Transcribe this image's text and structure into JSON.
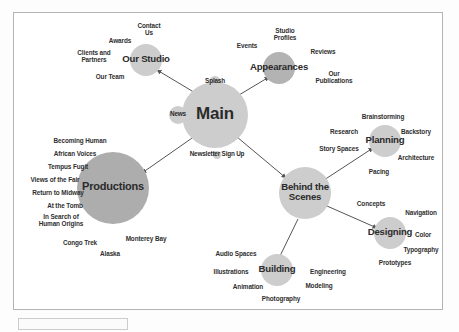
{
  "diagram": {
    "background": "#ffffff",
    "frame_border": "#b4b4b4",
    "node_color_light": "#cdcdcd",
    "node_color_mid": "#b3b3b3",
    "node_color_dark": "#adadad",
    "edge_color": "#555555",
    "text_color": "#2b2b2b"
  },
  "nodes": [
    {
      "id": "main",
      "label": "Main",
      "cx": 215,
      "cy": 115,
      "r": 33,
      "font": 17,
      "tone": "light"
    },
    {
      "id": "our_studio",
      "label": "Our Studio",
      "cx": 146,
      "cy": 60,
      "r": 16,
      "font": 9.6,
      "tone": "light"
    },
    {
      "id": "appearances",
      "label": "Appearances",
      "cx": 279,
      "cy": 68,
      "r": 16,
      "font": 9.6,
      "tone": "mid"
    },
    {
      "id": "productions",
      "label": "Productions",
      "cx": 113,
      "cy": 188,
      "r": 36,
      "font": 11,
      "tone": "dark"
    },
    {
      "id": "behind",
      "label": "Behind the\nScenes",
      "cx": 305,
      "cy": 193,
      "r": 26,
      "font": 9.6,
      "tone": "light"
    },
    {
      "id": "planning",
      "label": "Planning",
      "cx": 385,
      "cy": 141,
      "r": 16,
      "font": 9.6,
      "tone": "light"
    },
    {
      "id": "designing",
      "label": "Designing",
      "cx": 390,
      "cy": 233,
      "r": 16,
      "font": 9.6,
      "tone": "light"
    },
    {
      "id": "building",
      "label": "Building",
      "cx": 277,
      "cy": 270,
      "r": 16,
      "font": 9.6,
      "tone": "light"
    },
    {
      "id": "news",
      "label": "News",
      "cx": 178,
      "cy": 115,
      "r": 9,
      "font": 6.4,
      "tone": "light"
    },
    {
      "id": "splash",
      "label": "Splash",
      "cx": 215,
      "cy": 82,
      "r": 6,
      "font": 6.4,
      "tone": "light"
    },
    {
      "id": "newsletter",
      "label": "Newsletter Sign Up",
      "cx": 217,
      "cy": 155,
      "r": 4,
      "font": 6.4,
      "tone": "light"
    }
  ],
  "edges": [
    {
      "from": "main",
      "to": "our_studio",
      "x1": 197,
      "y1": 94,
      "x2": 157,
      "y2": 70,
      "arrow": true
    },
    {
      "from": "main",
      "to": "appearances",
      "x1": 234,
      "y1": 98,
      "x2": 269,
      "y2": 77,
      "arrow": true
    },
    {
      "from": "main",
      "to": "productions",
      "x1": 195,
      "y1": 136,
      "x2": 142,
      "y2": 173,
      "arrow": true
    },
    {
      "from": "main",
      "to": "behind",
      "x1": 237,
      "y1": 137,
      "x2": 286,
      "y2": 178,
      "arrow": true
    },
    {
      "from": "behind",
      "to": "planning",
      "x1": 324,
      "y1": 180,
      "x2": 373,
      "y2": 148,
      "arrow": true
    },
    {
      "from": "behind",
      "to": "designing",
      "x1": 327,
      "y1": 206,
      "x2": 377,
      "y2": 228,
      "arrow": true
    },
    {
      "from": "behind",
      "to": "building",
      "x1": 298,
      "y1": 219,
      "x2": 280,
      "y2": 256,
      "arrow": false
    }
  ],
  "labels": [
    {
      "text": "Contact\nUs",
      "x": 126,
      "y": 22,
      "w": 46
    },
    {
      "text": "Awards",
      "x": 97,
      "y": 37,
      "w": 46
    },
    {
      "text": "Clients and\nPartners",
      "x": 66,
      "y": 49,
      "w": 56
    },
    {
      "text": "Our Team",
      "x": 85,
      "y": 73,
      "w": 50
    },
    {
      "text": "Studio\nProfiles",
      "x": 262,
      "y": 27,
      "w": 46
    },
    {
      "text": "Events",
      "x": 227,
      "y": 42,
      "w": 40
    },
    {
      "text": "Reviews",
      "x": 300,
      "y": 48,
      "w": 46
    },
    {
      "text": "Our\nPublications",
      "x": 304,
      "y": 70,
      "w": 60
    },
    {
      "text": "Becoming Human",
      "x": 42,
      "y": 137,
      "w": 76
    },
    {
      "text": "African Voices",
      "x": 39,
      "y": 150,
      "w": 72
    },
    {
      "text": "Tempus Fugit",
      "x": 32,
      "y": 163,
      "w": 72
    },
    {
      "text": "Views of the Fair",
      "x": 15,
      "y": 176,
      "w": 80
    },
    {
      "text": "Return to Midway",
      "x": 17,
      "y": 189,
      "w": 82
    },
    {
      "text": "At the Tomb",
      "x": 29,
      "y": 202,
      "w": 72
    },
    {
      "text": "In Search of\nHuman Origins",
      "x": 22,
      "y": 213,
      "w": 78
    },
    {
      "text": "Congo Trek",
      "x": 51,
      "y": 239,
      "w": 58
    },
    {
      "text": "Monterey Bay",
      "x": 113,
      "y": 235,
      "w": 66
    },
    {
      "text": "Alaska",
      "x": 87,
      "y": 250,
      "w": 46
    },
    {
      "text": "Brainstorming",
      "x": 348,
      "y": 113,
      "w": 70
    },
    {
      "text": "Research",
      "x": 318,
      "y": 128,
      "w": 52
    },
    {
      "text": "Backstory",
      "x": 388,
      "y": 128,
      "w": 56
    },
    {
      "text": "Story Spaces",
      "x": 306,
      "y": 145,
      "w": 66
    },
    {
      "text": "Architecture",
      "x": 384,
      "y": 154,
      "w": 64
    },
    {
      "text": "Pacing",
      "x": 357,
      "y": 168,
      "w": 44
    },
    {
      "text": "Concepts",
      "x": 345,
      "y": 200,
      "w": 52
    },
    {
      "text": "Navigation",
      "x": 392,
      "y": 209,
      "w": 58
    },
    {
      "text": "Color",
      "x": 404,
      "y": 231,
      "w": 38
    },
    {
      "text": "Typography",
      "x": 390,
      "y": 246,
      "w": 62
    },
    {
      "text": "Prototypes",
      "x": 366,
      "y": 259,
      "w": 58
    },
    {
      "text": "Audio Spaces",
      "x": 203,
      "y": 250,
      "w": 66
    },
    {
      "text": "Illustrations",
      "x": 200,
      "y": 268,
      "w": 62
    },
    {
      "text": "Engineering",
      "x": 296,
      "y": 268,
      "w": 64
    },
    {
      "text": "Animation",
      "x": 220,
      "y": 283,
      "w": 56
    },
    {
      "text": "Modeling",
      "x": 293,
      "y": 282,
      "w": 52
    },
    {
      "text": "Photography",
      "x": 248,
      "y": 295,
      "w": 66
    }
  ]
}
